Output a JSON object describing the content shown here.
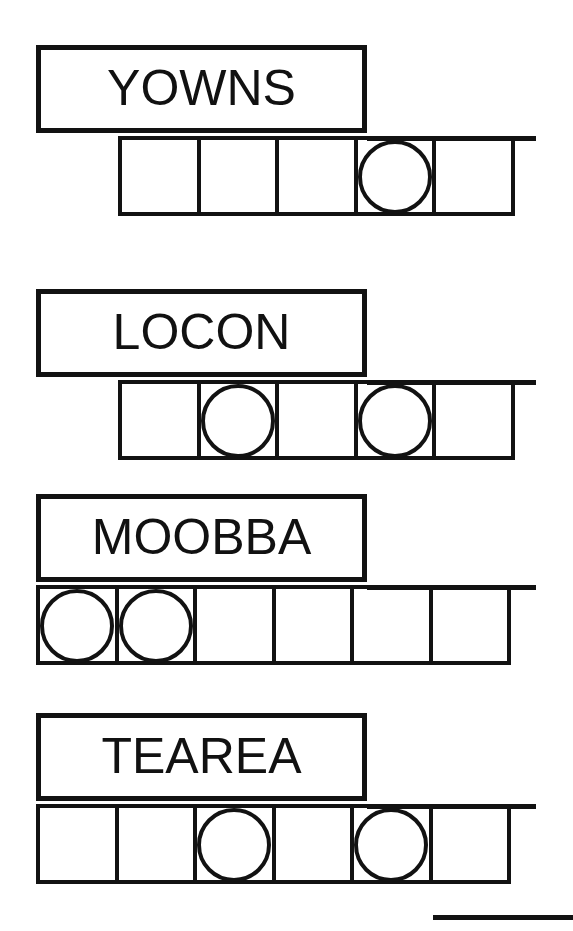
{
  "page": {
    "background_color": "#ffffff",
    "ink_color": "#121212",
    "width": 573,
    "height": 931
  },
  "puzzles": [
    {
      "id": "puzzle-1",
      "word": "YOWNS",
      "letter_count": 5,
      "strip_alignment": "indented",
      "cells": [
        {
          "index": 1,
          "marker": "none"
        },
        {
          "index": 2,
          "marker": "none"
        },
        {
          "index": 3,
          "marker": "none"
        },
        {
          "index": 4,
          "marker": "circle"
        },
        {
          "index": 5,
          "marker": "none"
        }
      ]
    },
    {
      "id": "puzzle-2",
      "word": "LOCON",
      "letter_count": 5,
      "strip_alignment": "indented",
      "cells": [
        {
          "index": 1,
          "marker": "none"
        },
        {
          "index": 2,
          "marker": "circle"
        },
        {
          "index": 3,
          "marker": "none"
        },
        {
          "index": 4,
          "marker": "circle"
        },
        {
          "index": 5,
          "marker": "none"
        }
      ]
    },
    {
      "id": "puzzle-3",
      "word": "MOOBBA",
      "letter_count": 6,
      "strip_alignment": "flush",
      "cells": [
        {
          "index": 1,
          "marker": "circle"
        },
        {
          "index": 2,
          "marker": "circle"
        },
        {
          "index": 3,
          "marker": "none"
        },
        {
          "index": 4,
          "marker": "none"
        },
        {
          "index": 5,
          "marker": "none"
        },
        {
          "index": 6,
          "marker": "none"
        }
      ]
    },
    {
      "id": "puzzle-4",
      "word": "TEAREA",
      "letter_count": 6,
      "strip_alignment": "flush",
      "cells": [
        {
          "index": 1,
          "marker": "none"
        },
        {
          "index": 2,
          "marker": "none"
        },
        {
          "index": 3,
          "marker": "circle"
        },
        {
          "index": 4,
          "marker": "none"
        },
        {
          "index": 5,
          "marker": "circle"
        },
        {
          "index": 6,
          "marker": "none"
        }
      ]
    }
  ],
  "footer": {
    "rule_present": true
  }
}
